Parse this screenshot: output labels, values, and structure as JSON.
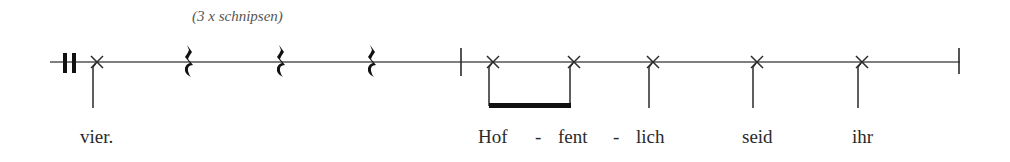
{
  "annotation": {
    "text": "(3 x schnipsen)",
    "x": 192,
    "y": 9
  },
  "colors": {
    "ink": "#2a2a2a",
    "staff": "#555555",
    "annotation": "#555555"
  },
  "staff": {
    "y": 62,
    "x_start": 50,
    "x_end": 960
  },
  "repeat_sign": {
    "bars": [
      {
        "x": 63,
        "w": 4
      },
      {
        "x": 72,
        "w": 4
      }
    ],
    "y_top": 53,
    "y_bottom": 73
  },
  "barlines": [
    {
      "x": 461,
      "y_top": 48,
      "y_bottom": 76
    },
    {
      "x": 959,
      "y_top": 48,
      "y_bottom": 74
    }
  ],
  "notes": [
    {
      "type": "x-notehead",
      "x": 97,
      "stem_bottom": 108
    },
    {
      "type": "x-notehead",
      "x": 493,
      "stem_bottom": 106
    },
    {
      "type": "x-notehead",
      "x": 574,
      "stem_bottom": 106
    },
    {
      "type": "x-notehead",
      "x": 653,
      "stem_bottom": 108
    },
    {
      "type": "x-notehead",
      "x": 757,
      "stem_bottom": 108
    },
    {
      "type": "x-notehead",
      "x": 862,
      "stem_bottom": 108
    }
  ],
  "beam": {
    "x_start": 489,
    "x_end": 571,
    "y": 103,
    "h": 5
  },
  "rests": [
    {
      "type": "quarter-rest",
      "x": 189
    },
    {
      "type": "quarter-rest",
      "x": 281
    },
    {
      "type": "quarter-rest",
      "x": 372
    }
  ],
  "lyrics": [
    {
      "text": "vier.",
      "x": 80
    },
    {
      "text": "Hof",
      "x": 478
    },
    {
      "text": "-",
      "x": 535
    },
    {
      "text": "fent",
      "x": 558
    },
    {
      "text": "-",
      "x": 613
    },
    {
      "text": "lich",
      "x": 636
    },
    {
      "text": "seid",
      "x": 742
    },
    {
      "text": "ihr",
      "x": 852
    }
  ],
  "lyrics_y": 127
}
